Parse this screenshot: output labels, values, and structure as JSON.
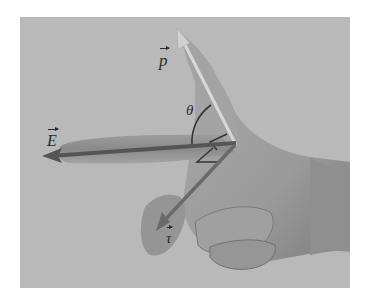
{
  "figure": {
    "background_color": "#b9b9b9",
    "arrow_color": "#555555",
    "labels": {
      "dipole_moment": "p",
      "electric_field": "E",
      "torque": "τ",
      "angle": "θ"
    },
    "vectors": [
      {
        "name": "p",
        "direction": "up-left along index finger"
      },
      {
        "name": "E",
        "direction": "left along middle finger"
      },
      {
        "name": "τ",
        "direction": "down-left along curled finger"
      }
    ],
    "annotations": [
      "right-angle marker between E and τ",
      "right-angle marker between p and τ",
      "arc marking angle θ between p and E"
    ]
  }
}
